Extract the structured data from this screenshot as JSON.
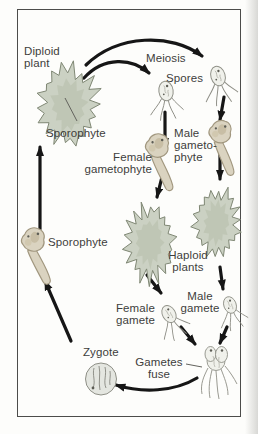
{
  "diagram": {
    "type": "plant-life-cycle-diagram",
    "labels": {
      "diploid_plant": "Diploid\nplant",
      "meiosis": "Meiosis",
      "spores": "Spores",
      "sporophyte_top": "Sporophyte",
      "male_gametophyte": "Male\ngameto-\nphyte",
      "female_gametophyte": "Female\ngametophyte",
      "haploid_plants": "Haploid\nplants",
      "sporophyte_left": "Sporophyte",
      "female_gamete": "Female\ngamete",
      "male_gamete": "Male\ngamete",
      "zygote": "Zygote",
      "gametes_fuse": "Gametes\nfuse"
    },
    "icons": {
      "sporophyte_plant": "leafy-seaweed-plant",
      "haploid_plant_left": "leafy-seaweed-plant",
      "haploid_plant_right": "leafy-seaweed-plant",
      "spore_left": "flagellated-cell",
      "spore_right": "flagellated-cell",
      "female_gametophyte_germling": "tadpole-germling",
      "male_gametophyte_germling": "tadpole-germling",
      "sporophyte_germling": "tadpole-germling",
      "female_gamete_cell": "flagellated-cell",
      "male_gamete_cell": "flagellated-cell",
      "fused_gametes_cell": "fusing-flagellated-cells",
      "zygote_cell": "round-zygote-cell",
      "arrows": "thick-black-curved-arrows"
    },
    "colors": {
      "background": "#fdfdfb",
      "frame_border": "#4c4c4a",
      "arrow": "#161616",
      "text": "#3d3d3b",
      "plant_fill": "#cbd1c3",
      "plant_inner": "#b6beaa",
      "plant_stroke": "#7f8774",
      "germling_fill": "#dad3c0",
      "germling_stroke": "#a1977f",
      "cell_fill": "#f0f1eb",
      "cell_stroke": "#8f9087",
      "zygote_fill": "#e4e6e0"
    }
  }
}
